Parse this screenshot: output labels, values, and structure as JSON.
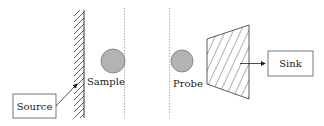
{
  "diagram": {
    "type": "schematic",
    "labels": {
      "source": "Source",
      "sample": "Sample",
      "probe": "Probe",
      "sink": "Sink"
    },
    "elements": [
      {
        "id": "source",
        "kind": "box",
        "label": "Source"
      },
      {
        "id": "wall",
        "kind": "hatched-wall"
      },
      {
        "id": "sample",
        "kind": "circle",
        "label": "Sample"
      },
      {
        "id": "probe",
        "kind": "circle",
        "label": "Probe"
      },
      {
        "id": "absorber",
        "kind": "hatched-trapezoid"
      },
      {
        "id": "sink",
        "kind": "box",
        "label": "Sink"
      }
    ],
    "connections": [
      {
        "from": "source",
        "to": "wall",
        "arrow": true
      },
      {
        "from": "absorber",
        "to": "sink",
        "arrow": true
      }
    ],
    "colors": {
      "stroke": "#333333",
      "circle_fill": "#b3b3b3",
      "circle_stroke": "#777777",
      "dotted": "#888888"
    }
  }
}
